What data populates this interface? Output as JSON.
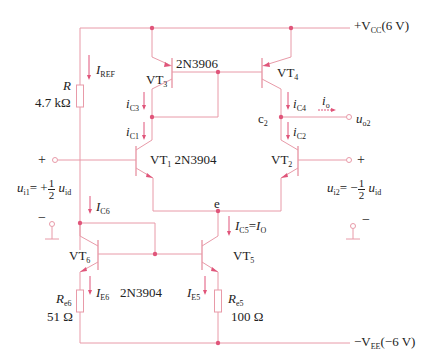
{
  "supply": {
    "vcc_label": "+V",
    "vcc_sub": "CC",
    "vcc_value": "(6 V)",
    "vee_label": "−V",
    "vee_sub": "EE",
    "vee_value": "(−6 V)"
  },
  "transistors": {
    "vt1": {
      "name": "VT",
      "sub": "1",
      "model": "2N3904"
    },
    "vt2": {
      "name": "VT",
      "sub": "2"
    },
    "vt3": {
      "name": "VT",
      "sub": "3",
      "model": "2N3906"
    },
    "vt4": {
      "name": "VT",
      "sub": "4"
    },
    "vt5": {
      "name": "VT",
      "sub": "5"
    },
    "vt6": {
      "name": "VT",
      "sub": "6",
      "model": "2N3904"
    }
  },
  "resistors": {
    "r": {
      "name": "R",
      "value": "4.7 kΩ"
    },
    "re6": {
      "name": "R",
      "sub": "e6",
      "value": "51 Ω"
    },
    "re5": {
      "name": "R",
      "sub": "e5",
      "value": "100 Ω"
    }
  },
  "currents": {
    "iref": {
      "sym": "I",
      "sub": "REF"
    },
    "ic3": {
      "sym": "i",
      "sub": "C3"
    },
    "ic1": {
      "sym": "i",
      "sub": "C1"
    },
    "ic4": {
      "sym": "i",
      "sub": "C4"
    },
    "ic2": {
      "sym": "i",
      "sub": "C2"
    },
    "io": {
      "sym": "i",
      "sub": "o"
    },
    "ic6": {
      "sym": "I",
      "sub": "C6"
    },
    "ic5": {
      "sym": "I",
      "sub": "C5",
      "eq": "=",
      "rhs": "I",
      "rhs_sub": "O"
    },
    "ie6": {
      "sym": "I",
      "sub": "E6"
    },
    "ie5": {
      "sym": "I",
      "sub": "E5"
    }
  },
  "nodes": {
    "c2": {
      "name": "c",
      "sub": "2"
    },
    "e": {
      "name": "e"
    },
    "uo2": {
      "sym": "u",
      "sub": "o2"
    }
  },
  "inputs": {
    "left": {
      "plus": "+",
      "minus": "−",
      "sym": "u",
      "sub": "i1",
      "eq": "= +",
      "num": "1",
      "den": "2",
      "rhs": "u",
      "rhs_sub": "id"
    },
    "right": {
      "plus": "+",
      "minus": "−",
      "sym": "u",
      "sub": "i2",
      "eq": "= −",
      "num": "1",
      "den": "2",
      "rhs": "u",
      "rhs_sub": "id"
    }
  },
  "colors": {
    "wire": "#e89aa8",
    "junction": "#e0557a",
    "text": "#222222"
  }
}
